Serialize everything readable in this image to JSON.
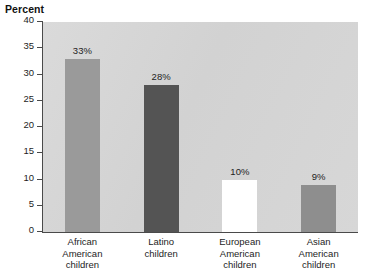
{
  "chart_data": {
    "type": "bar",
    "title": "Percent",
    "xlabel": "",
    "ylabel": "Percent",
    "ylim": [
      0,
      40
    ],
    "yticks": [
      0,
      5,
      10,
      15,
      20,
      25,
      30,
      35,
      40
    ],
    "ytick_labels": [
      "0",
      "5",
      "10",
      "15",
      "20",
      "25",
      "30",
      "35",
      "40"
    ],
    "grid": false,
    "legend": false,
    "categories": [
      "African American children",
      "Latino children",
      "European American children",
      "Asian American children"
    ],
    "category_lines": [
      [
        "African",
        "American",
        "children"
      ],
      [
        "Latino",
        "children"
      ],
      [
        "European",
        "American",
        "children"
      ],
      [
        "Asian",
        "American",
        "children"
      ]
    ],
    "values": [
      33,
      28,
      10,
      9
    ],
    "value_labels": [
      "33%",
      "28%",
      "10%",
      "9%"
    ],
    "bar_colors": [
      "#9a9a9a",
      "#545454",
      "#ffffff",
      "#8e8e8e"
    ],
    "plot_background": "#d6d6d6",
    "axis_color": "#4a4a4a",
    "figure_background": "#ffffff"
  }
}
